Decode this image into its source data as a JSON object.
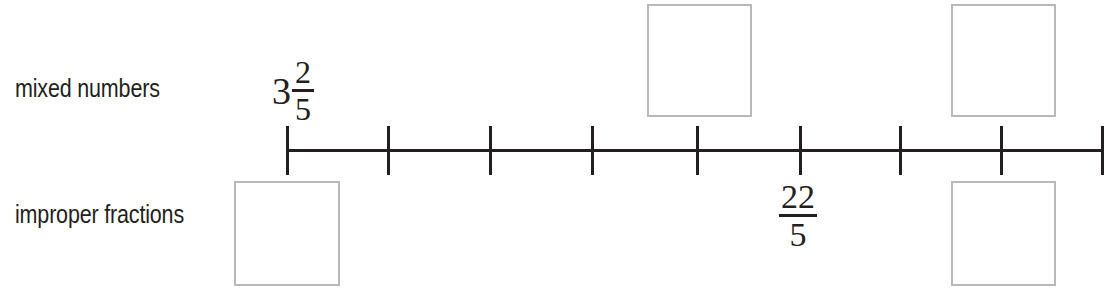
{
  "worksheet": {
    "width": 1109,
    "height": 291,
    "background_color": "#ffffff",
    "ink_color": "#231f20",
    "box_border_color": "#b9b9b9"
  },
  "rows": {
    "top_label": "mixed numbers",
    "bottom_label": "improper fractions"
  },
  "number_line": {
    "tick_count": 9,
    "tick_positions_px": [
      287,
      388,
      490,
      592,
      697,
      800,
      900,
      1001,
      1102
    ],
    "line_start_px": 286,
    "line_end_px": 1103,
    "line_y_px": 150,
    "tick_top_px": 126,
    "tick_bottom_px": 175
  },
  "labels": {
    "mixed_number_3_2_5": {
      "whole": "3",
      "numerator": "2",
      "denominator": "5",
      "tick_index": 1
    },
    "improper_fraction_22_5": {
      "numerator": "22",
      "denominator": "5",
      "tick_index": 6
    }
  },
  "answer_boxes": [
    {
      "id": "box-top-tick5",
      "row": "mixed numbers",
      "tick_index": 5,
      "value": ""
    },
    {
      "id": "box-top-tick8",
      "row": "mixed numbers",
      "tick_index": 8,
      "value": ""
    },
    {
      "id": "box-bottom-tick1",
      "row": "improper fractions",
      "tick_index": 1,
      "value": ""
    },
    {
      "id": "box-bottom-tick8",
      "row": "improper fractions",
      "tick_index": 8,
      "value": ""
    }
  ]
}
